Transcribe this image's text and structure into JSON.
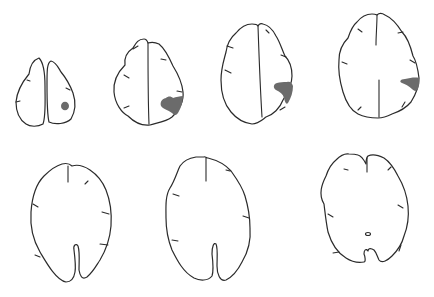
{
  "figure": {
    "rows": [
      {
        "row": "top",
        "slices": [
          {
            "index": 1,
            "lesion": true,
            "lesion_shape": "small-round",
            "side": "image-right"
          },
          {
            "index": 2,
            "lesion": true,
            "lesion_shape": "wedge",
            "side": "image-right"
          },
          {
            "index": 3,
            "lesion": true,
            "lesion_shape": "wedge",
            "side": "image-right"
          },
          {
            "index": 4,
            "lesion": true,
            "lesion_shape": "wedge",
            "side": "image-right"
          }
        ]
      },
      {
        "row": "bottom",
        "slices": [
          {
            "index": 5,
            "lesion": false
          },
          {
            "index": 6,
            "lesion": false
          },
          {
            "index": 7,
            "lesion": false,
            "feature": "small-central-ring"
          }
        ]
      }
    ],
    "colors": {
      "outline": "#2b2b2b",
      "lesion": "#6b6b6b",
      "background": "#ffffff"
    }
  }
}
